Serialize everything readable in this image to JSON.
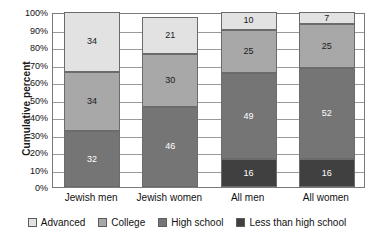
{
  "chart_data": {
    "type": "bar",
    "subtype": "stacked-100-percent",
    "title": "",
    "xlabel": "",
    "ylabel": "Cumulative percent",
    "ylim": [
      0,
      100
    ],
    "ytick_labels": [
      "0%",
      "10%",
      "20%",
      "30%",
      "40%",
      "50%",
      "60%",
      "70%",
      "80%",
      "90%",
      "100%"
    ],
    "ytick_values": [
      0,
      10,
      20,
      30,
      40,
      50,
      60,
      70,
      80,
      90,
      100
    ],
    "grid": true,
    "legend_position": "bottom",
    "categories": [
      "Jewish men",
      "Jewish women",
      "All men",
      "All women"
    ],
    "series": [
      {
        "name": "Less than high school",
        "color": "#404040",
        "values": [
          0,
          0,
          16,
          16
        ]
      },
      {
        "name": "High school",
        "color": "#757575",
        "values": [
          32,
          46,
          49,
          52
        ]
      },
      {
        "name": "College",
        "color": "#a8a8a8",
        "values": [
          34,
          30,
          25,
          25
        ]
      },
      {
        "name": "Advanced",
        "color": "#e2e2e2",
        "values": [
          34,
          21,
          10,
          7
        ]
      }
    ],
    "stack_order_bottom_to_top": [
      "Less than high school",
      "High school",
      "College",
      "Advanced"
    ],
    "data_labels": {
      "Jewish men": {
        "Less than high school": "0",
        "High school": "32",
        "College": "34",
        "Advanced": "34"
      },
      "Jewish women": {
        "Less than high school": "0",
        "High school": "46",
        "College": "30",
        "Advanced": "21"
      },
      "All men": {
        "Less than high school": "16",
        "High school": "49",
        "College": "25",
        "Advanced": "10"
      },
      "All women": {
        "Less than high school": "16",
        "High school": "52",
        "College": "25",
        "Advanced": "7"
      }
    }
  },
  "legend": {
    "items": [
      {
        "label": "Advanced",
        "color": "#e2e2e2"
      },
      {
        "label": "College",
        "color": "#a8a8a8"
      },
      {
        "label": "High school",
        "color": "#757575"
      },
      {
        "label": "Less than high school",
        "color": "#404040"
      }
    ]
  }
}
